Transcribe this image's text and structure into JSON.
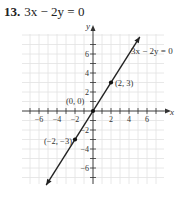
{
  "problem": {
    "number": "13.",
    "equation": "3x − 2y = 0"
  },
  "chart_data": {
    "type": "line",
    "title": "3x − 2y = 0",
    "xlabel": "x",
    "ylabel": "y",
    "xlim": [
      -7.8,
      7.8
    ],
    "ylim": [
      -8,
      8.2
    ],
    "grid": true,
    "x_ticks": [
      -6,
      -4,
      -2,
      2,
      4,
      6
    ],
    "y_ticks": [
      -6,
      -4,
      -2,
      2,
      4,
      6
    ],
    "x_tick_labels": [
      "−6",
      "−4",
      "−2",
      "2",
      "4",
      "6"
    ],
    "y_tick_labels": [
      "−6",
      "−4",
      "−2",
      "2",
      "4",
      "6"
    ],
    "series": [
      {
        "name": "3x − 2y = 0",
        "x": [
          -5.2,
          5.2
        ],
        "y": [
          -7.8,
          7.8
        ]
      }
    ],
    "points": [
      {
        "x": 0,
        "y": 0,
        "label": "(0, 0)"
      },
      {
        "x": 2,
        "y": 3,
        "label": "(2, 3)"
      },
      {
        "x": -2,
        "y": -3,
        "label": "(−2, −3)"
      }
    ],
    "annotations": [
      {
        "text": "3x − 2y = 0",
        "x": 4.2,
        "y": 6.4
      }
    ]
  }
}
